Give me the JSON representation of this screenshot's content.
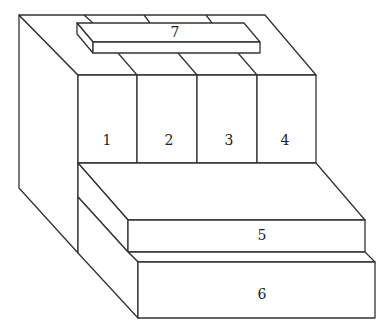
{
  "diagram": {
    "type": "isometric-block-drawing",
    "stroke_color": "#333333",
    "background": "#ffffff",
    "labels": {
      "block1": "1",
      "block2": "2",
      "block3": "3",
      "block4": "4",
      "block5": "5",
      "block6": "6",
      "block7": "7"
    }
  }
}
